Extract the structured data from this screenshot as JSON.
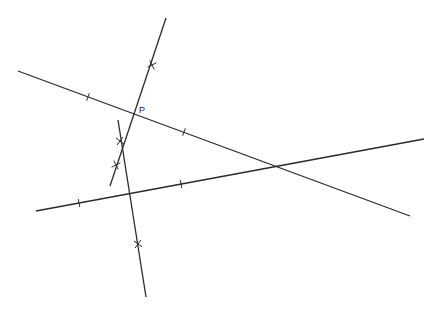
{
  "diagram": {
    "stroke_color": "#2a2a2a",
    "point_label": "P",
    "point_label_pos": [
      139,
      105
    ],
    "point": [
      135,
      115
    ],
    "lines": [
      {
        "id": "line-a",
        "from": [
          18,
          71
        ],
        "to": [
          410,
          216
        ],
        "marks": [
          {
            "type": "tick",
            "at": [
              88,
              97
            ]
          },
          {
            "type": "tick",
            "at": [
              184,
              132
            ]
          }
        ]
      },
      {
        "id": "line-b",
        "from": [
          36,
          211
        ],
        "to": [
          424,
          139
        ],
        "marks": [
          {
            "type": "tick",
            "at": [
              79,
              203
            ]
          },
          {
            "type": "tick",
            "at": [
              181,
              184
            ]
          }
        ]
      },
      {
        "id": "line-c",
        "from": [
          166,
          18
        ],
        "to": [
          110,
          186
        ],
        "marks": [
          {
            "type": "cross",
            "at": [
              152,
              65
            ]
          },
          {
            "type": "cross",
            "at": [
              116,
              165
            ]
          }
        ]
      },
      {
        "id": "line-d",
        "from": [
          118,
          120
        ],
        "to": [
          146,
          297
        ],
        "marks": [
          {
            "type": "cross",
            "at": [
              120,
              141
            ]
          },
          {
            "type": "cross",
            "at": [
              138,
              244
            ]
          }
        ]
      }
    ]
  }
}
